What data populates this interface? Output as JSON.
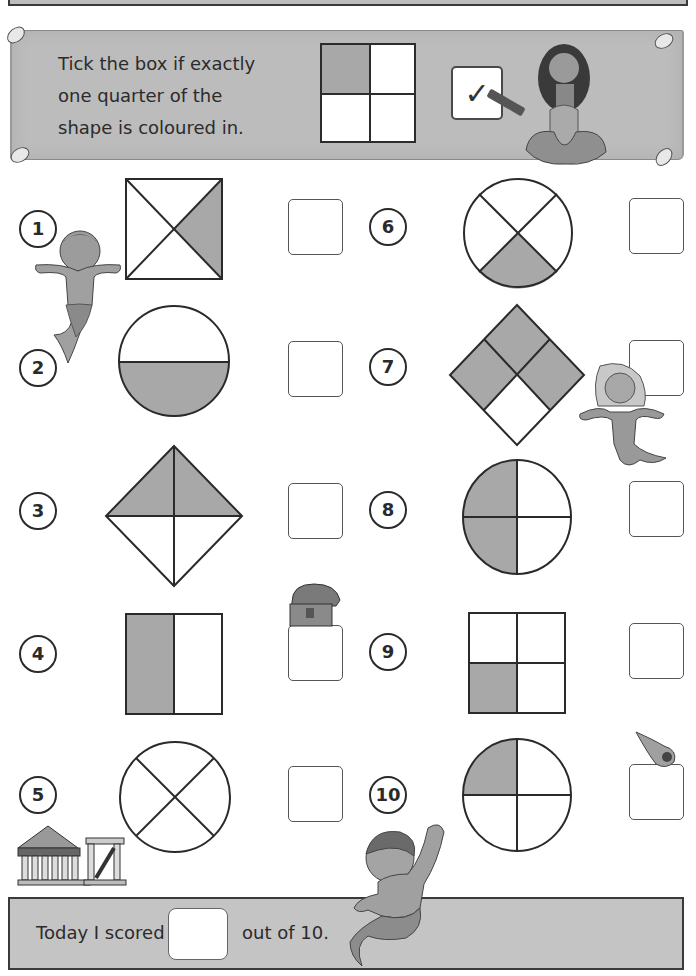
{
  "header": {
    "title": ""
  },
  "banner": {
    "instruction_lines": [
      "Tick the box if exactly",
      "one quarter of the",
      "shape is coloured in."
    ],
    "example": {
      "shape": "square-2x2-grid",
      "shaded": "top-left quarter",
      "tick_mark": "✓"
    }
  },
  "colors": {
    "shade": "#a8a8a8",
    "banner_bg": "#bcbcbc",
    "footer_bg": "#c4c4c4",
    "outline": "#2a2a2a"
  },
  "questions": [
    {
      "number": "1",
      "shape": "square with diagonals",
      "shaded_parts": 1,
      "total_parts": 4,
      "shaded_region": "right triangle"
    },
    {
      "number": "2",
      "shape": "circle halved horizontally",
      "shaded_parts": 1,
      "total_parts": 2,
      "shaded_region": "bottom half"
    },
    {
      "number": "3",
      "shape": "diamond split into 4 triangles",
      "shaded_parts": 2,
      "total_parts": 4,
      "shaded_region": "top half"
    },
    {
      "number": "4",
      "shape": "rectangle halved vertically",
      "shaded_parts": 1,
      "total_parts": 2,
      "shaded_region": "left half"
    },
    {
      "number": "5",
      "shape": "circle with diagonal cross",
      "shaded_parts": 0,
      "total_parts": 4,
      "shaded_region": "none"
    },
    {
      "number": "6",
      "shape": "circle with diagonal cross",
      "shaded_parts": 1,
      "total_parts": 4,
      "shaded_region": "bottom quarter"
    },
    {
      "number": "7",
      "shape": "diamond 2x2 grid",
      "shaded_parts": 3,
      "total_parts": 4,
      "shaded_region": "top, left and right quarters"
    },
    {
      "number": "8",
      "shape": "circle in quarters",
      "shaded_parts": 2,
      "total_parts": 4,
      "shaded_region": "left half"
    },
    {
      "number": "9",
      "shape": "square 2x2 grid",
      "shaded_parts": 1,
      "total_parts": 4,
      "shaded_region": "bottom-left quarter"
    },
    {
      "number": "10",
      "shape": "circle in quarters",
      "shaded_parts": 1,
      "total_parts": 4,
      "shaded_region": "top-left quarter"
    }
  ],
  "footer": {
    "prefix": "Today I scored",
    "suffix": "out of 10.",
    "score_value": ""
  },
  "decorations": {
    "icons": [
      "merman-icon",
      "mermaid-icon",
      "treasure-chest-icon",
      "shell-icon",
      "greek-temple-icon",
      "pin-icon",
      "pencil-icon"
    ]
  }
}
